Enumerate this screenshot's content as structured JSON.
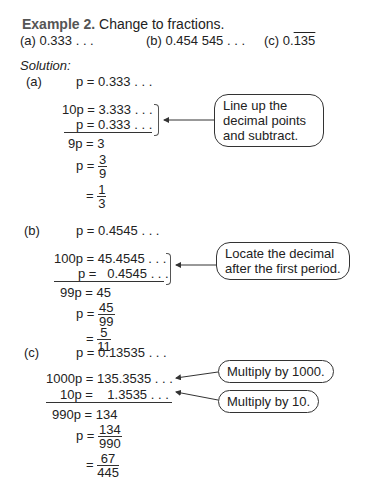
{
  "header": {
    "example_label": "Example 2.",
    "instruction": "Change to fractions.",
    "parts": [
      {
        "label": "(a)",
        "value": "0.333 . . ."
      },
      {
        "label": "(b)",
        "value": "0.454 545 . . ."
      },
      {
        "label": "(c)",
        "prefix": "0.",
        "repeating": "135"
      }
    ]
  },
  "solution_label": "Solution:",
  "part_a": {
    "label": "(a)",
    "lines": [
      "p = 0.333 . . .",
      "10p = 3.333 . . .",
      "p = 0.333 . . .",
      "9p = 3"
    ],
    "frac1": {
      "lhs": "p =",
      "num": "3",
      "den": "9"
    },
    "frac2": {
      "lhs": "=",
      "num": "1",
      "den": "3"
    },
    "note": [
      "Line up the",
      "decimal points",
      "and subtract."
    ]
  },
  "part_b": {
    "label": "(b)",
    "lines": [
      "p = 0.4545 . . .",
      "100p = 45.4545 . . .",
      "p =   0.4545 . . .",
      "99p = 45"
    ],
    "frac1": {
      "lhs": "p =",
      "num": "45",
      "den": "99"
    },
    "frac2": {
      "lhs": "=",
      "num": "5",
      "den": "11"
    },
    "note": [
      "Locate the decimal",
      "after the first period."
    ]
  },
  "part_c": {
    "label": "(c)",
    "lines": [
      "p = 0.13535 . . .",
      "1000p = 135.3535 . . .",
      "10p =    1.3535 . . .",
      "990p = 134"
    ],
    "frac1": {
      "lhs": "p =",
      "num": "134",
      "den": "990"
    },
    "frac2": {
      "lhs": "=",
      "num": "67",
      "den": "445"
    },
    "note1": "Multiply by 1000.",
    "note2": "Multiply by 10."
  }
}
